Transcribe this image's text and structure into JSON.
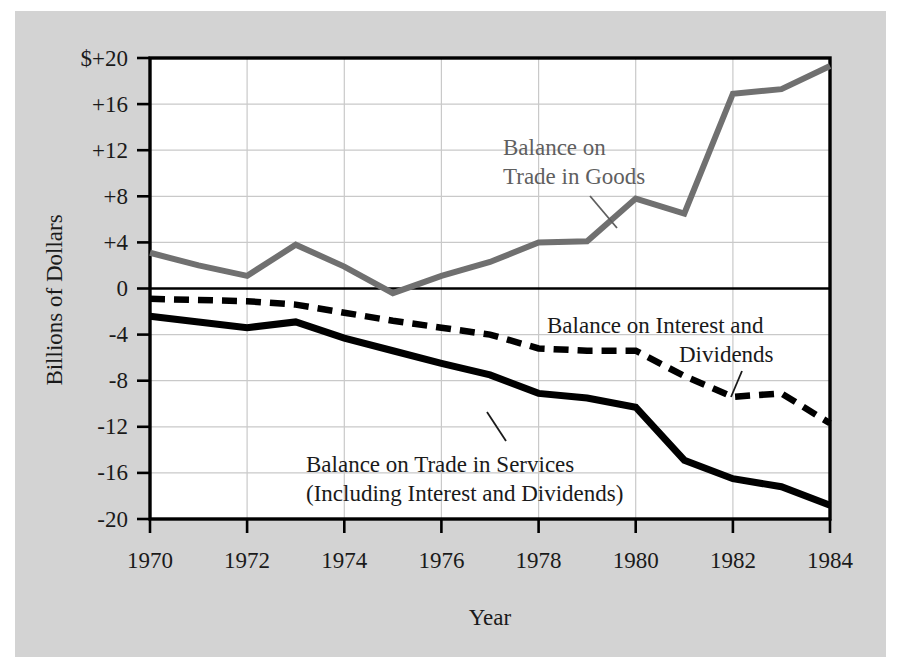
{
  "figure": {
    "background_color": "#d3d3d3",
    "plot_background_color": "#ffffff",
    "frame_color": "#000000"
  },
  "chart_data": {
    "type": "line",
    "title": "",
    "xlabel": "Year",
    "ylabel": "Billions of Dollars",
    "xlim": [
      1970,
      1984
    ],
    "ylim": [
      -20,
      20
    ],
    "xticks": [
      1970,
      1972,
      1974,
      1976,
      1978,
      1980,
      1982,
      1984
    ],
    "xtick_labels": [
      "1970",
      "1972",
      "1974",
      "1976",
      "1978",
      "1980",
      "1982",
      "1984"
    ],
    "yticks": [
      20,
      16,
      12,
      8,
      4,
      0,
      -4,
      -8,
      -12,
      -16,
      -20
    ],
    "ytick_labels": [
      "$+20",
      "+16",
      "+12",
      "+8",
      "+4",
      "0",
      "-4",
      "-8",
      "-12",
      "-16",
      "-20"
    ],
    "grid": true,
    "legend_position": "inline-annotations",
    "x": [
      1970,
      1971,
      1972,
      1973,
      1974,
      1975,
      1976,
      1977,
      1978,
      1979,
      1980,
      1981,
      1982,
      1983,
      1984
    ],
    "series": [
      {
        "name": "Balance on Trade in Goods",
        "style": "solid",
        "color": "#707070",
        "linewidth": 6,
        "values": [
          3.1,
          2.0,
          1.1,
          3.8,
          1.9,
          -0.4,
          1.1,
          2.3,
          4.0,
          4.1,
          7.8,
          6.5,
          16.9,
          17.3,
          19.3
        ]
      },
      {
        "name": "Balance on Interest and Dividends",
        "style": "dashed",
        "color": "#000000",
        "linewidth": 6,
        "values": [
          -0.9,
          -1.0,
          -1.1,
          -1.4,
          -2.1,
          -2.8,
          -3.4,
          -4.0,
          -5.2,
          -5.4,
          -5.4,
          -7.6,
          -9.4,
          -9.1,
          -11.7
        ]
      },
      {
        "name": "Balance on Trade in Services (Including Interest and Dividends)",
        "style": "solid",
        "color": "#000000",
        "linewidth": 7,
        "values": [
          -2.4,
          -2.9,
          -3.4,
          -2.9,
          -4.3,
          -5.4,
          -6.5,
          -7.5,
          -9.1,
          -9.5,
          -10.3,
          -14.9,
          -16.5,
          -17.2,
          -18.8
        ]
      }
    ],
    "annotations": [
      {
        "id": "annot-goods",
        "lines": [
          "Balance on",
          "Trade in Goods"
        ],
        "color": "#5f5f5f",
        "leader": true
      },
      {
        "id": "annot-interest",
        "lines": [
          "Balance on  Interest and",
          "Dividends"
        ],
        "color": "#1a1a1a",
        "leader": true
      },
      {
        "id": "annot-services",
        "lines": [
          "Balance on Trade in Services",
          "(Including Interest and Dividends)"
        ],
        "color": "#1a1a1a",
        "leader": true
      }
    ]
  },
  "annot_goods": {
    "line1": "Balance on",
    "line2": "Trade in Goods"
  },
  "annot_interest": {
    "line1": "Balance on  Interest and",
    "line2": "Dividends"
  },
  "annot_services": {
    "line1": "Balance on Trade in Services",
    "line2": "(Including Interest and Dividends)"
  },
  "axis": {
    "y_title": "Billions of Dollars",
    "x_title": "Year"
  }
}
